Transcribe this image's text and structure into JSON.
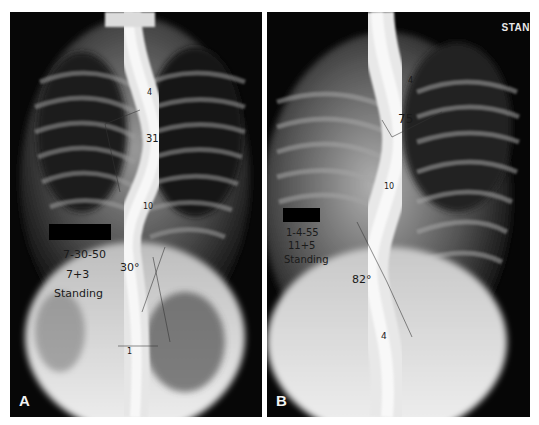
{
  "figure": {
    "panels": [
      {
        "id": "A",
        "label": "A",
        "date": "7-30-50",
        "age": "7+3",
        "position": "Standing",
        "angle": "30°",
        "upper_angle": "31°",
        "vertebra_marks": [
          "4",
          "10",
          "1"
        ]
      },
      {
        "id": "B",
        "label": "B",
        "date": "1-4-55",
        "age": "11+5",
        "position": "Standing",
        "angle": "82°",
        "upper_angle": "75",
        "vertebra_marks": [
          "4",
          "10",
          "4"
        ],
        "corner_marker": "STAN"
      }
    ]
  }
}
